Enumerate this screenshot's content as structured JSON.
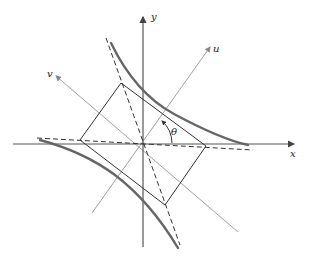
{
  "diagram": {
    "type": "coordinate-rotation-hyperbola",
    "labels": {
      "x_axis": "x",
      "y_axis": "y",
      "u_axis": "u",
      "v_axis": "v",
      "angle": "θ"
    },
    "colors": {
      "axes": "#555555",
      "rotated_axes": "#999999",
      "hyperbola": "#666666",
      "rectangle": "#333333",
      "asymptotes": "#333333"
    },
    "elements": [
      "x-axis with arrow",
      "y-axis with arrow",
      "rotated u-axis with arrow",
      "rotated v-axis with arrow",
      "hyperbola branches (upper-right, lower-left)",
      "central rectangle",
      "dashed asymptotes",
      "angle theta arc between x and u axes"
    ]
  }
}
